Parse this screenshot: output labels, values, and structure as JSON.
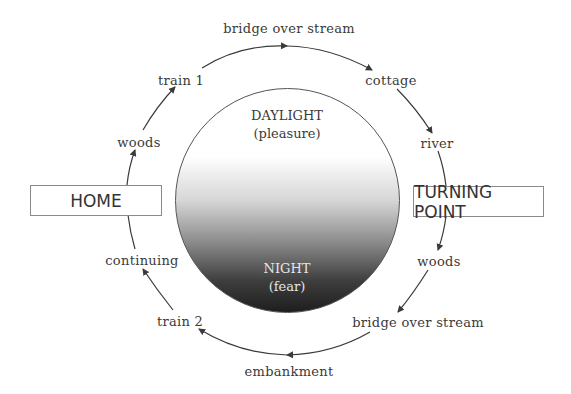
{
  "diagram": {
    "center": {
      "top_label": "DAYLIGHT",
      "top_sublabel": "(pleasure)",
      "bottom_label": "NIGHT",
      "bottom_sublabel": "(fear)"
    },
    "home": {
      "label": "HOME"
    },
    "turning_point": {
      "label": "TURNING POINT"
    },
    "outbound": [
      {
        "label": "woods"
      },
      {
        "label": "train 1"
      },
      {
        "label": "bridge over stream"
      },
      {
        "label": "cottage"
      },
      {
        "label": "river"
      }
    ],
    "return": [
      {
        "label": "woods"
      },
      {
        "label": "bridge over stream"
      },
      {
        "label": "embankment"
      },
      {
        "label": "train 2"
      },
      {
        "label": "continuing"
      }
    ]
  },
  "colors": {
    "line": "#3a3a3a",
    "box_border": "#8a8a8a",
    "text": "#3a3a3a",
    "circle_top": "#ffffff",
    "circle_bottom": "#1e1e1e"
  }
}
